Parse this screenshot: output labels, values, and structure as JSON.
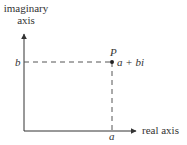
{
  "diagram": {
    "imaginary_axis_label": [
      "imaginary",
      "axis"
    ],
    "real_axis_label": "real axis",
    "point": {
      "name": "P",
      "expression": "a + bi",
      "x_label": "a",
      "y_label": "b"
    },
    "colors": {
      "axis": "#333333",
      "dashed": "#555555",
      "text": "#333333"
    }
  }
}
